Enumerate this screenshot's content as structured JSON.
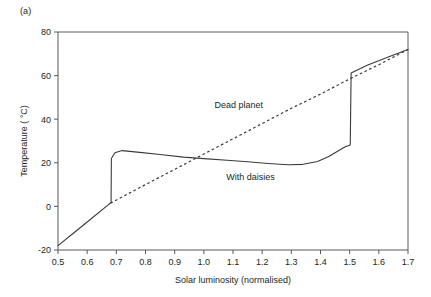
{
  "figure": {
    "panel_label": "(a)",
    "background_color": "#ffffff",
    "axis_color": "#58595b",
    "curve_color": "#3b3b3d"
  },
  "chart_data": {
    "type": "line",
    "title": "",
    "xlabel": "Solar luminosity (normalised)",
    "ylabel": "Temperature ( °C)",
    "xlim": [
      0.5,
      1.7
    ],
    "ylim": [
      -20,
      80
    ],
    "xticks": [
      0.5,
      0.6,
      0.7,
      0.8,
      0.9,
      1.0,
      1.1,
      1.2,
      1.3,
      1.4,
      1.5,
      1.6,
      1.7
    ],
    "xtick_labels": [
      "0.5",
      "0.6",
      "0.7",
      "0.8",
      "0.9",
      "1.0",
      "1.1",
      "1.2",
      "1.3",
      "1.4",
      "1.5",
      "1.6",
      "1.7"
    ],
    "yticks": [
      -20,
      0,
      20,
      40,
      60,
      80
    ],
    "ytick_labels": [
      "-20",
      "0",
      "20",
      "40",
      "60",
      "80"
    ],
    "grid": false,
    "legend": "inline-annotations",
    "series": [
      {
        "name": "Dead planet",
        "style": "dashed",
        "label_x": 1.12,
        "label_y": 45,
        "points": [
          [
            0.68,
            1.5
          ],
          [
            0.8,
            10.0
          ],
          [
            0.9,
            17.0
          ],
          [
            1.0,
            24.0
          ],
          [
            1.1,
            31.0
          ],
          [
            1.2,
            38.0
          ],
          [
            1.3,
            45.0
          ],
          [
            1.4,
            51.5
          ],
          [
            1.5,
            58.5
          ],
          [
            1.6,
            65.0
          ],
          [
            1.7,
            72.0
          ]
        ]
      },
      {
        "name": "With daisies",
        "style": "solid",
        "label_x": 1.16,
        "label_y": 12,
        "points": [
          [
            0.5,
            -18.0
          ],
          [
            0.56,
            -11.5
          ],
          [
            0.62,
            -5.0
          ],
          [
            0.67,
            0.5
          ],
          [
            0.682,
            1.8
          ],
          [
            0.683,
            22.0
          ],
          [
            0.695,
            24.6
          ],
          [
            0.72,
            25.6
          ],
          [
            0.78,
            24.8
          ],
          [
            0.85,
            23.8
          ],
          [
            0.93,
            22.6
          ],
          [
            1.0,
            21.9
          ],
          [
            1.08,
            21.2
          ],
          [
            1.15,
            20.5
          ],
          [
            1.22,
            19.7
          ],
          [
            1.29,
            19.1
          ],
          [
            1.34,
            19.3
          ],
          [
            1.39,
            20.6
          ],
          [
            1.43,
            23.0
          ],
          [
            1.46,
            25.4
          ],
          [
            1.485,
            27.4
          ],
          [
            1.502,
            28.2
          ],
          [
            1.505,
            61.2
          ],
          [
            1.56,
            64.7
          ],
          [
            1.63,
            68.4
          ],
          [
            1.7,
            72.0
          ]
        ]
      }
    ],
    "annotations": [
      {
        "text": "Dead planet",
        "x": 1.12,
        "y": 45
      },
      {
        "text": "With daisies",
        "x": 1.16,
        "y": 12
      }
    ]
  }
}
